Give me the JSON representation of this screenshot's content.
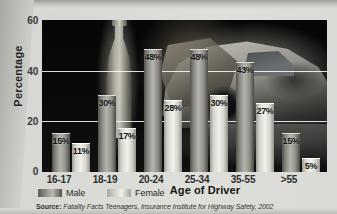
{
  "chart_data": {
    "type": "bar",
    "title": "",
    "xlabel": "Age of Driver",
    "ylabel": "Percentage",
    "categories": [
      "16-17",
      "18-19",
      "20-24",
      "25-34",
      "35-55",
      ">55"
    ],
    "series": [
      {
        "name": "Male",
        "values": [
          15,
          30,
          48,
          48,
          43,
          15
        ],
        "labels": [
          "15%",
          "30%",
          "48%",
          "48%",
          "43%",
          "15%"
        ],
        "color": "#9c9b94"
      },
      {
        "name": "Female",
        "values": [
          11,
          17,
          28,
          30,
          27,
          5
        ],
        "labels": [
          "11%",
          "17%",
          "28%",
          "30%",
          "27%",
          "5%"
        ],
        "color": "#e9e8e0"
      }
    ],
    "ylim": [
      0,
      60
    ],
    "yticks": [
      "0",
      "20",
      "40",
      "60"
    ],
    "ytick_values": [
      0,
      20,
      40,
      60
    ],
    "grid": true,
    "legend_position": "below-left",
    "plot_background": "dark photograph of a beer bottle and a crashed car"
  },
  "axis": {
    "y_label": "Percentage",
    "x_label": "Age of Driver",
    "y_ticks": [
      "60",
      "40",
      "20",
      "0"
    ],
    "x_ticks": [
      "16-17",
      "18-19",
      "20-24",
      "25-34",
      "35-55",
      ">55"
    ]
  },
  "legend": {
    "items": [
      {
        "label": "Male",
        "swatch": "male-swatch"
      },
      {
        "label": "Female",
        "swatch": "female-swatch"
      }
    ]
  },
  "source": {
    "prefix": "Source:",
    "text": "Fatality Facts Teenagers, Insurance Institute for Highway Safety, 2002"
  },
  "colors": {
    "page": "#d8d8d5",
    "plot_background": "#070707",
    "gridline": "#ffffff",
    "male_bar": "#9c9b94",
    "female_bar": "#eeede6",
    "text": "#232320"
  }
}
